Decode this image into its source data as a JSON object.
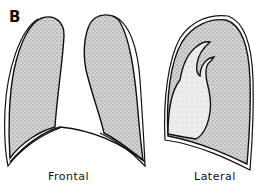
{
  "figure": {
    "panel_label": "B",
    "views": [
      {
        "id": "frontal",
        "caption": "Frontal"
      },
      {
        "id": "lateral",
        "caption": "Lateral"
      }
    ],
    "colors": {
      "outline": "#111111",
      "lung_fill": "#cfcfcf",
      "stipple": "#6b6b6b",
      "background": "#ffffff"
    }
  }
}
